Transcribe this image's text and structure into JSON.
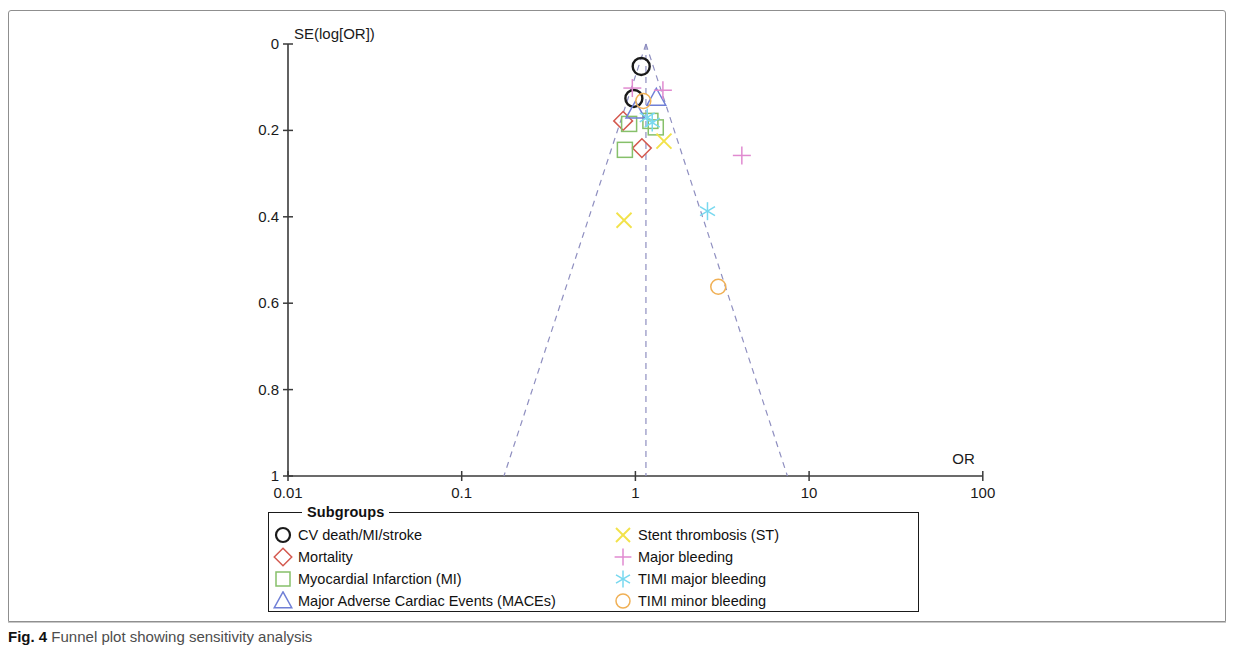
{
  "figure": {
    "caption_label": "Fig. 4",
    "caption_text": "Funnel plot showing sensitivity analysis"
  },
  "legend": {
    "title": "Subgroups",
    "items": [
      {
        "label": "CV death/MI/stroke",
        "marker": "circle",
        "color": "#1a1a1a",
        "column": "left"
      },
      {
        "label": "Mortality",
        "marker": "diamond",
        "color": "#d4594f",
        "column": "left"
      },
      {
        "label": "Myocardial Infarction (MI)",
        "marker": "square",
        "color": "#86c06a",
        "column": "left"
      },
      {
        "label": "Major Adverse Cardiac Events (MACEs)",
        "marker": "triangle",
        "color": "#6f7fd6",
        "column": "left"
      },
      {
        "label": "Stent thrombosis (ST)",
        "marker": "cross-x",
        "color": "#f2e24a",
        "column": "right"
      },
      {
        "label": "Major bleeding",
        "marker": "plus",
        "color": "#e08ad0",
        "column": "right"
      },
      {
        "label": "TIMI major bleeding",
        "marker": "asterisk",
        "color": "#78d8ef",
        "column": "right"
      },
      {
        "label": "TIMI minor bleeding",
        "marker": "circle",
        "color": "#f0b055",
        "column": "right"
      }
    ]
  },
  "chart_data": {
    "type": "scatter",
    "title": "Funnel plot showing sensitivity analysis",
    "xlabel": "OR",
    "ylabel": "SE(log[OR])",
    "x_scale": "log",
    "xlim": [
      0.01,
      100
    ],
    "ylim": [
      0,
      1
    ],
    "y_inverted": true,
    "grid": false,
    "legend_position": "below-plot",
    "x_ticks": [
      "0.01",
      "0.1",
      "1",
      "10",
      "100"
    ],
    "x_tick_values": [
      0.01,
      0.1,
      1,
      10,
      100
    ],
    "y_ticks": [
      "0",
      "0.2",
      "0.4",
      "0.6",
      "0.8",
      "1"
    ],
    "y_tick_values": [
      0,
      0.2,
      0.4,
      0.6,
      0.8,
      1
    ],
    "funnel": {
      "center_or": 1.15,
      "apex_se": 0.0,
      "left_base_or": 0.175,
      "right_base_or": 7.5,
      "line_style": "dashed",
      "line_color": "#8f8fc0"
    },
    "series": [
      {
        "name": "CV death/MI/stroke",
        "marker": "circle",
        "color": "#1a1a1a",
        "points": [
          {
            "or": 1.08,
            "se": 0.052
          },
          {
            "or": 0.98,
            "se": 0.126
          }
        ]
      },
      {
        "name": "Mortality",
        "marker": "diamond",
        "color": "#d4594f",
        "points": [
          {
            "or": 0.85,
            "se": 0.178
          },
          {
            "or": 1.09,
            "se": 0.241
          }
        ]
      },
      {
        "name": "Myocardial Infarction (MI)",
        "marker": "square",
        "color": "#86c06a",
        "points": [
          {
            "or": 0.92,
            "se": 0.185
          },
          {
            "or": 1.22,
            "se": 0.178
          },
          {
            "or": 1.31,
            "se": 0.193
          },
          {
            "or": 0.87,
            "se": 0.245
          }
        ]
      },
      {
        "name": "Major Adverse Cardiac Events (MACEs)",
        "marker": "triangle",
        "color": "#6f7fd6",
        "points": [
          {
            "or": 1.32,
            "se": 0.125
          },
          {
            "or": 1.0,
            "se": 0.155
          }
        ]
      },
      {
        "name": "Stent thrombosis (ST)",
        "marker": "cross-x",
        "color": "#f2e24a",
        "points": [
          {
            "or": 0.86,
            "se": 0.408
          },
          {
            "or": 1.46,
            "se": 0.225
          }
        ]
      },
      {
        "name": "Major bleeding",
        "marker": "plus",
        "color": "#e08ad0",
        "points": [
          {
            "or": 0.96,
            "se": 0.102
          },
          {
            "or": 1.44,
            "se": 0.107
          },
          {
            "or": 4.1,
            "se": 0.258
          }
        ]
      },
      {
        "name": "TIMI major bleeding",
        "marker": "asterisk",
        "color": "#78d8ef",
        "points": [
          {
            "or": 1.17,
            "se": 0.17
          },
          {
            "or": 1.25,
            "se": 0.182
          },
          {
            "or": 2.6,
            "se": 0.387
          }
        ]
      },
      {
        "name": "TIMI minor bleeding",
        "marker": "circle",
        "color": "#f0b055",
        "points": [
          {
            "or": 1.11,
            "se": 0.132
          },
          {
            "or": 3.0,
            "se": 0.562
          }
        ]
      }
    ]
  }
}
